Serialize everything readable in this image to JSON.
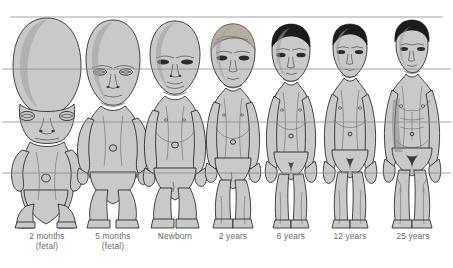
{
  "diagram": {
    "figure_fill": "#c9c9c9",
    "figure_outline": "#1a1a1a",
    "hair_dark": "#1c1c1c",
    "hair_light": "#b0a99a",
    "guide_line_color": "#8c8c8c",
    "background": "#ffffff",
    "caption_color": "#6a6a6a",
    "guide_lines": [
      {
        "name": "head-top-line",
        "y": 17
      },
      {
        "name": "eye-chin-line",
        "y": 69
      },
      {
        "name": "pubis-line",
        "y": 122
      },
      {
        "name": "knee-line",
        "y": 173
      }
    ],
    "baseline_y": 228,
    "stages": [
      {
        "id": "stage-2-months-fetal",
        "label": "2 months",
        "sublabel": "(fetal)",
        "center_x": 47,
        "hair": "none",
        "head_ratio": "1/2",
        "notes": "very large cranium, tiny body, bowed legs"
      },
      {
        "id": "stage-5-months-fetal",
        "label": "5 months",
        "sublabel": "(fetal)",
        "center_x": 113,
        "hair": "none",
        "head_ratio": "1/3",
        "notes": "large head, short limbs"
      },
      {
        "id": "stage-newborn",
        "label": "Newborn",
        "sublabel": "",
        "center_x": 175,
        "hair": "none",
        "head_ratio": "1/4",
        "notes": "bald, rounded abdomen"
      },
      {
        "id": "stage-2-years",
        "label": "2 years",
        "sublabel": "",
        "center_x": 233,
        "hair": "light",
        "head_ratio": "1/5",
        "notes": "toddler, light hair, protruding belly"
      },
      {
        "id": "stage-6-years",
        "label": "6 years",
        "sublabel": "",
        "center_x": 291,
        "hair": "dark",
        "head_ratio": "1/6",
        "notes": "child, slimmer trunk, longer legs"
      },
      {
        "id": "stage-12-years",
        "label": "12 years",
        "sublabel": "",
        "center_x": 350,
        "hair": "dark",
        "head_ratio": "1/7",
        "notes": "pre-adolescent, broader shoulders"
      },
      {
        "id": "stage-25-years",
        "label": "25 years",
        "sublabel": "",
        "center_x": 412,
        "hair": "dark",
        "head_ratio": "1/8",
        "notes": "adult male, muscled torso, long legs"
      }
    ]
  }
}
